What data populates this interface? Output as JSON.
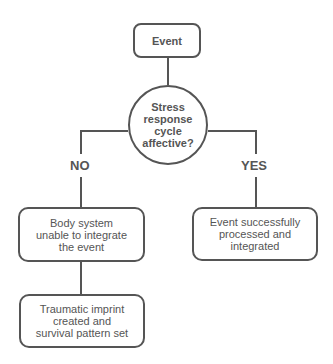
{
  "diagram": {
    "type": "flowchart",
    "nodes": {
      "start": {
        "label": "Event"
      },
      "decision": {
        "label": "Stress\nresponse\ncycle\naffective?"
      },
      "no_result": {
        "label": "Body system\nunable to integrate\nthe event"
      },
      "yes_result": {
        "label": "Event successfully\nprocessed and\nintegrated"
      },
      "no_outcome": {
        "label": "Traumatic imprint\ncreated and\nsurvival pattern set"
      }
    },
    "branches": {
      "no": "NO",
      "yes": "YES"
    },
    "edges": [
      {
        "from": "start",
        "to": "decision"
      },
      {
        "from": "decision",
        "to": "no_result",
        "label": "NO"
      },
      {
        "from": "decision",
        "to": "yes_result",
        "label": "YES"
      },
      {
        "from": "no_result",
        "to": "no_outcome"
      }
    ],
    "colors": {
      "stroke": "#555555",
      "text": "#555555",
      "background": "#ffffff"
    }
  }
}
